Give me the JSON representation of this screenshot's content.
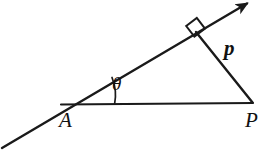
{
  "figure": {
    "kind": "geometry-diagram",
    "background_color": "#ffffff",
    "stroke_color": "#1a1a1a",
    "canvas": {
      "width": 272,
      "height": 157
    }
  },
  "labels": {
    "vertex_a": "A",
    "vertex_p": "P",
    "side_p": "p",
    "angle_theta": "θ"
  },
  "points": {
    "A": {
      "x": 68,
      "y": 104
    },
    "P": {
      "x": 252,
      "y": 103
    },
    "foot": {
      "x": 196,
      "y": 33
    },
    "ray_tail": {
      "x": 2,
      "y": 148
    },
    "ray_head": {
      "x": 249,
      "y": 2
    }
  },
  "segments": [
    {
      "name": "ray-through-a",
      "from": "ray_tail",
      "to": "ray_head",
      "arrow_at_end": true
    },
    {
      "name": "base-a-to-p",
      "from": "A",
      "to": "P",
      "arrow_at_end": false
    },
    {
      "name": "perpendicular-p",
      "from": "foot",
      "to": "P",
      "arrow_at_end": false
    }
  ],
  "marks": {
    "right_angle": {
      "at": "foot",
      "size": 12,
      "type": "square"
    },
    "angle_arc": {
      "at": "A",
      "radius": 46,
      "type": "arc"
    }
  }
}
